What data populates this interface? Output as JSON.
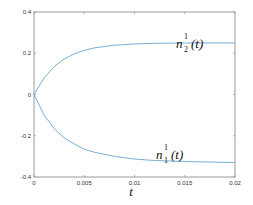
{
  "chart_data": {
    "type": "line",
    "title": "",
    "xlabel": "t",
    "ylabel": "",
    "xlim": [
      0,
      0.02
    ],
    "ylim": [
      -0.4,
      0.4
    ],
    "x_ticks": [
      "0",
      "0.005",
      "0.01",
      "0.015",
      "0.02"
    ],
    "y_ticks": [
      "0.4",
      "0.2",
      "0",
      "-0.2",
      "-0.4"
    ],
    "grid": false,
    "series": [
      {
        "name": "n_2^1(t)",
        "label_base": "n",
        "label_sup": "1",
        "label_sub": "2",
        "label_arg": "(t)",
        "color": "#7aaed6",
        "x": [
          0,
          0.001,
          0.002,
          0.003,
          0.004,
          0.005,
          0.006,
          0.008,
          0.01,
          0.012,
          0.015,
          0.02
        ],
        "values": [
          0,
          0.08,
          0.135,
          0.172,
          0.197,
          0.214,
          0.226,
          0.239,
          0.245,
          0.248,
          0.25,
          0.25
        ]
      },
      {
        "name": "n_1^1(t)",
        "label_base": "n",
        "label_sup": "1",
        "label_sub": "1",
        "label_arg": "(t)",
        "color": "#7aaed6",
        "x": [
          0,
          0.001,
          0.002,
          0.003,
          0.004,
          0.005,
          0.006,
          0.008,
          0.01,
          0.012,
          0.015,
          0.02
        ],
        "values": [
          0,
          -0.1,
          -0.165,
          -0.21,
          -0.24,
          -0.265,
          -0.28,
          -0.3,
          -0.313,
          -0.32,
          -0.325,
          -0.33
        ]
      }
    ]
  }
}
